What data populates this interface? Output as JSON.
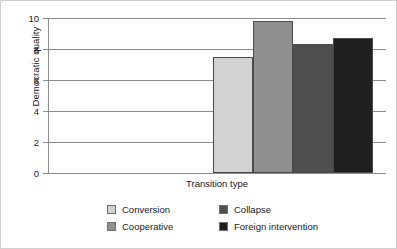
{
  "chart_data": {
    "type": "bar",
    "title": "",
    "xlabel": "Transition type",
    "ylabel": "Democratic quality",
    "categories": [
      "Conversion",
      "Cooperative",
      "Collapse",
      "Foreign intervention"
    ],
    "values": [
      7.5,
      9.8,
      8.3,
      8.7
    ],
    "ylim": [
      0,
      10
    ],
    "ytick_labels": [
      "0",
      "2",
      "4",
      "6",
      "8",
      "10"
    ],
    "ytick_values": [
      0,
      2,
      4,
      6,
      8,
      10
    ],
    "xtick_labels": [],
    "grid": "horizontal",
    "legend_position": "bottom",
    "series": [
      {
        "name": "Conversion",
        "value": 7.5,
        "color": "#d2d2d2"
      },
      {
        "name": "Cooperative",
        "value": 9.8,
        "color": "#8f8f8f"
      },
      {
        "name": "Collapse",
        "value": 8.3,
        "color": "#4f4f4f"
      },
      {
        "name": "Foreign intervention",
        "value": 8.7,
        "color": "#1f1f1f"
      }
    ]
  },
  "axes": {
    "y_title": "Democratic quality",
    "x_title": "Transition type",
    "ticks": [
      {
        "label": "10",
        "value": 10
      },
      {
        "label": "8",
        "value": 8
      },
      {
        "label": "6",
        "value": 6
      },
      {
        "label": "4",
        "value": 4
      },
      {
        "label": "2",
        "value": 2
      },
      {
        "label": "0",
        "value": 0
      }
    ]
  },
  "legend": {
    "entries": [
      {
        "label": "Conversion",
        "color": "#d2d2d2"
      },
      {
        "label": "Collapse",
        "color": "#4f4f4f"
      },
      {
        "label": "Cooperative",
        "color": "#8f8f8f"
      },
      {
        "label": "Foreign intervention",
        "color": "#1f1f1f"
      }
    ]
  }
}
